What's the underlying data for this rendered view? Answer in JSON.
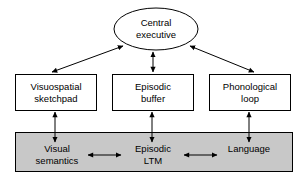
{
  "diagram": {
    "type": "block-diagram",
    "colors": {
      "stroke": "#000000",
      "node_fill": "#ffffff",
      "panel_fill": "#c8c8c8",
      "text": "#000000",
      "background": "#ffffff"
    },
    "nodes": {
      "central_executive": {
        "label": "Central\nexecutive",
        "shape": "ellipse",
        "fill": "#ffffff"
      },
      "visuospatial_sketchpad": {
        "label": "Visuospatial\nsketchpad",
        "shape": "rectangle",
        "fill": "#ffffff"
      },
      "episodic_buffer": {
        "label": "Episodic\nbuffer",
        "shape": "rectangle",
        "fill": "#ffffff"
      },
      "phonological_loop": {
        "label": "Phonological\nloop",
        "shape": "rectangle",
        "fill": "#ffffff"
      },
      "visual_semantics": {
        "label": "Visual\nsemantics",
        "shape": "text-in-panel",
        "fill": "#c8c8c8"
      },
      "episodic_ltm": {
        "label": "Episodic\nLTM",
        "shape": "text-in-panel",
        "fill": "#c8c8c8"
      },
      "language": {
        "label": "Language",
        "shape": "text-in-panel",
        "fill": "#c8c8c8"
      }
    },
    "panel": {
      "name": "long-term-memory-panel",
      "fill": "#c8c8c8"
    },
    "connectors": [
      {
        "from": "visuospatial_sketchpad",
        "to": "central_executive",
        "style": "double-arrow-diagonal"
      },
      {
        "from": "episodic_buffer",
        "to": "central_executive",
        "style": "double-arrow-vertical"
      },
      {
        "from": "phonological_loop",
        "to": "central_executive",
        "style": "double-arrow-diagonal"
      },
      {
        "from": "visual_semantics",
        "to": "visuospatial_sketchpad",
        "style": "double-arrow-vertical"
      },
      {
        "from": "episodic_ltm",
        "to": "episodic_buffer",
        "style": "double-arrow-vertical"
      },
      {
        "from": "language",
        "to": "phonological_loop",
        "style": "double-arrow-vertical"
      },
      {
        "from": "visual_semantics",
        "to": "episodic_ltm",
        "style": "double-arrow-horizontal"
      },
      {
        "from": "episodic_ltm",
        "to": "language",
        "style": "double-arrow-horizontal"
      }
    ]
  }
}
